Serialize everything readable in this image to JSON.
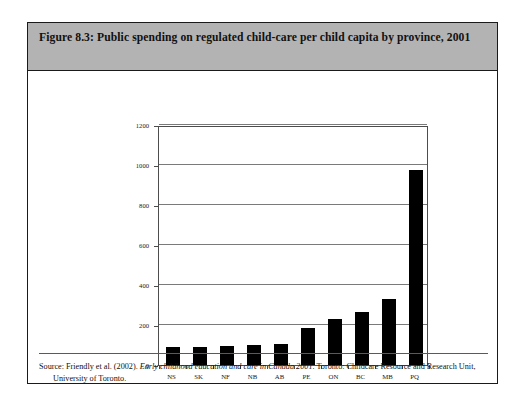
{
  "figure": {
    "title": "Figure 8.3: Public spending on regulated child-care per child capita by province, 2001",
    "source_prefix": "Source: Friendly et al. (2002). ",
    "source_italic": "Early childhood education and care in Canada 2001",
    "source_suffix": ". Toronto: Childcare Resource and Research Unit, University of Toronto."
  },
  "chart_data": {
    "type": "bar",
    "title": "",
    "xlabel": "",
    "ylabel": "$ per child 6-12 yrs",
    "categories": [
      "NS",
      "SK",
      "NF",
      "NB",
      "AB",
      "PE",
      "ON",
      "BC",
      "MB",
      "PQ"
    ],
    "values": [
      88,
      92,
      95,
      98,
      103,
      185,
      230,
      265,
      330,
      975
    ],
    "ylim": [
      0,
      1200
    ],
    "yticks": [
      0,
      200,
      400,
      600,
      800,
      1000,
      1200
    ],
    "ytick_labels": [
      "0",
      "200",
      "400",
      "600",
      "800",
      "1000",
      "1200"
    ],
    "grid": true,
    "legend": false,
    "bar_color": "#000000"
  }
}
